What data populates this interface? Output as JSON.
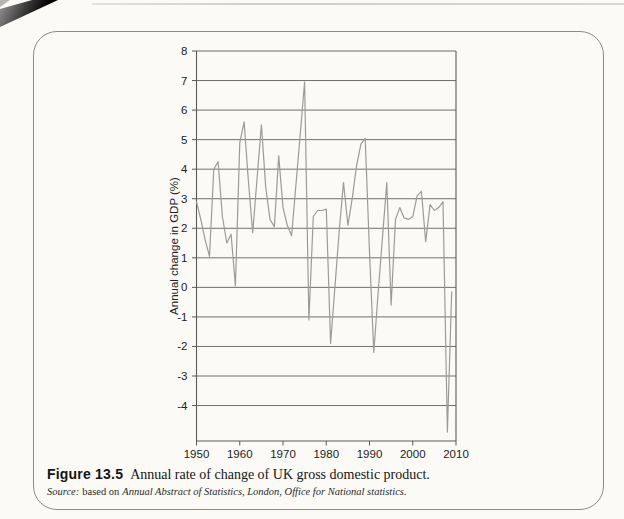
{
  "figure": {
    "caption_label": "Figure 13.5",
    "caption_text": "Annual rate of change of UK gross domestic product.",
    "source_label": "Source:",
    "source_based": "based on",
    "source_citation": "Annual Abstract of Statistics, London, Office for National statistics."
  },
  "chart_data": {
    "type": "line",
    "title": "",
    "xlabel": "",
    "ylabel": "Annual change in GDP (%)",
    "xlim": [
      1950,
      2010
    ],
    "ylim": [
      -5.2,
      8
    ],
    "x_ticks": [
      1950,
      1960,
      1970,
      1980,
      1990,
      2000,
      2010
    ],
    "y_ticks": [
      8,
      7,
      6,
      5,
      4,
      3,
      2,
      1,
      0,
      -1,
      -2,
      -3,
      -4
    ],
    "grid": "horizontal",
    "legend": "none",
    "colors": {
      "grid": "#6f6f6f",
      "axis": "#5a5a5a",
      "line": "#9b9b9b",
      "text": "#1c1c1c"
    },
    "series": [
      {
        "name": "UK annual GDP change (%)",
        "x": [
          1950,
          1951,
          1952,
          1953,
          1954,
          1955,
          1956,
          1957,
          1958,
          1959,
          1960,
          1961,
          1962,
          1963,
          1964,
          1965,
          1966,
          1967,
          1968,
          1969,
          1970,
          1971,
          1972,
          1973,
          1974,
          1975,
          1976,
          1977,
          1978,
          1979,
          1980,
          1981,
          1982,
          1983,
          1984,
          1985,
          1986,
          1987,
          1988,
          1989,
          1990,
          1991,
          1992,
          1993,
          1994,
          1995,
          1996,
          1997,
          1998,
          1999,
          2000,
          2001,
          2002,
          2003,
          2004,
          2005,
          2006,
          2007,
          2008,
          2009
        ],
        "values": [
          2.9,
          2.3,
          1.6,
          1.05,
          4.0,
          4.25,
          2.4,
          1.5,
          1.8,
          0.05,
          4.9,
          5.6,
          3.6,
          1.85,
          3.7,
          5.5,
          3.4,
          2.3,
          2.05,
          4.45,
          2.7,
          2.1,
          1.75,
          3.5,
          5.2,
          6.95,
          -1.1,
          2.4,
          2.6,
          2.6,
          2.65,
          -1.9,
          0.0,
          1.9,
          3.55,
          2.1,
          3.0,
          4.1,
          4.85,
          5.05,
          1.2,
          -2.2,
          -0.2,
          1.7,
          3.55,
          -0.6,
          2.3,
          2.7,
          2.35,
          2.3,
          2.4,
          3.1,
          3.25,
          1.55,
          2.8,
          2.6,
          2.7,
          2.9,
          -4.9,
          -0.15
        ]
      }
    ]
  }
}
